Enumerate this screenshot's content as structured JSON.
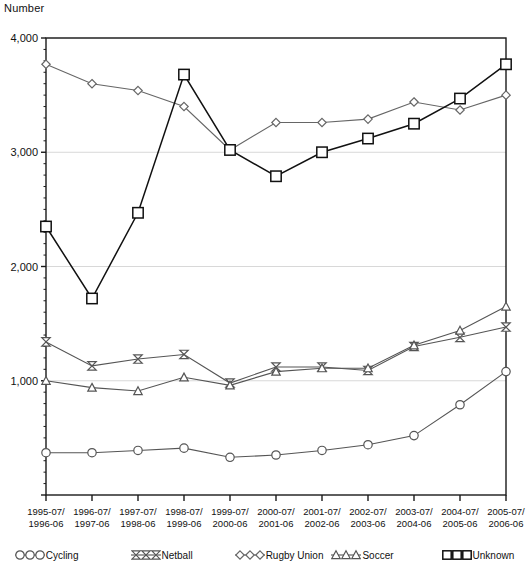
{
  "chart_data": {
    "type": "line",
    "title": "",
    "xlabel": "",
    "ylabel": "Number",
    "ylim": [
      0,
      4000
    ],
    "yticks": [
      0,
      1000,
      2000,
      3000,
      4000
    ],
    "ytick_labels": [
      "",
      "1,000",
      "2,000",
      "3,000",
      "4,000"
    ],
    "grid": true,
    "legend_position": "bottom",
    "categories": [
      "1995-07/\n1996-06",
      "1996-07/\n1997-06",
      "1997-07/\n1998-06",
      "1998-07/\n1999-06",
      "1999-07/\n2000-06",
      "2000-07/\n2001-06",
      "2001-07/\n2002-06",
      "2002-07/\n2003-06",
      "2003-07/\n2004-06",
      "2004-07/\n2005-06",
      "2005-07/\n2006-06"
    ],
    "categories_lines": [
      [
        "1995-07/",
        "1996-06"
      ],
      [
        "1996-07/",
        "1997-06"
      ],
      [
        "1997-07/",
        "1998-06"
      ],
      [
        "1998-07/",
        "1999-06"
      ],
      [
        "1999-07/",
        "2000-06"
      ],
      [
        "2000-07/",
        "2001-06"
      ],
      [
        "2001-07/",
        "2002-06"
      ],
      [
        "2002-07/",
        "2003-06"
      ],
      [
        "2003-07/",
        "2004-06"
      ],
      [
        "2004-07/",
        "2005-06"
      ],
      [
        "2005-07/",
        "2006-06"
      ]
    ],
    "series": [
      {
        "name": "Cycling",
        "marker": "circle",
        "color": "#555555",
        "values": [
          370,
          370,
          390,
          410,
          330,
          350,
          390,
          440,
          520,
          790,
          1080
        ]
      },
      {
        "name": "Netball",
        "marker": "bowtie",
        "color": "#555555",
        "values": [
          1340,
          1130,
          1190,
          1230,
          980,
          1120,
          1120,
          1090,
          1300,
          1380,
          1470
        ]
      },
      {
        "name": "Rugby Union",
        "marker": "diamond",
        "color": "#666666",
        "values": [
          3770,
          3600,
          3540,
          3400,
          3020,
          3260,
          3260,
          3290,
          3440,
          3370,
          3500
        ]
      },
      {
        "name": "Soccer",
        "marker": "triangle",
        "color": "#555555",
        "values": [
          1000,
          940,
          910,
          1030,
          960,
          1080,
          1110,
          1110,
          1310,
          1440,
          1650
        ]
      },
      {
        "name": "Unknown",
        "marker": "square",
        "color": "#111111",
        "values": [
          2350,
          1720,
          2470,
          3680,
          3020,
          2790,
          3000,
          3120,
          3250,
          3470,
          3770
        ]
      }
    ]
  }
}
